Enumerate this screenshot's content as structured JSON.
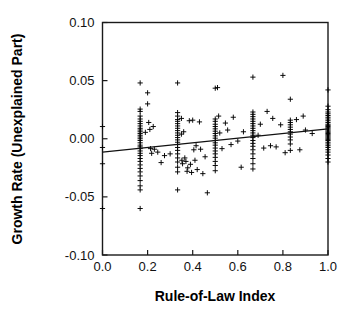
{
  "chart_data": {
    "type": "scatter",
    "title": "",
    "subtitle": "",
    "xlabel": "Rule-of-Law Index",
    "ylabel": "Growth Rate (Unexplained Part)",
    "xlim": [
      0.0,
      1.0
    ],
    "ylim": [
      -0.1,
      0.1
    ],
    "xticks": [
      0.0,
      0.2,
      0.4,
      0.6,
      0.8,
      1.0
    ],
    "xtick_labels": [
      "0.0",
      "0.2",
      "0.4",
      "0.6",
      "0.8",
      "1.0"
    ],
    "yticks": [
      -0.1,
      -0.05,
      0.0,
      0.05,
      0.1
    ],
    "ytick_labels": [
      "-0.10",
      "-0.05",
      "0.00",
      "0.05",
      "0.10"
    ],
    "grid": false,
    "legend": null,
    "marker": "plus",
    "marker_color": "#000000",
    "frame_color": "#1a1a1a",
    "background_color": "#ffffff",
    "annotations": [],
    "trendline": {
      "type": "linear-fit",
      "color": "#111111",
      "x_start": 0.0,
      "y_start": -0.0115,
      "x_end": 1.0,
      "y_end": 0.0085,
      "slope": 0.02,
      "intercept": -0.0115
    },
    "points": [
      [
        0.0,
        0.0105
      ],
      [
        0.0,
        -0.0075
      ],
      [
        0.0,
        -0.0215
      ],
      [
        0.0,
        -0.06
      ],
      [
        0.167,
        0.048
      ],
      [
        0.167,
        0.0255
      ],
      [
        0.167,
        0.0235
      ],
      [
        0.167,
        0.0195
      ],
      [
        0.167,
        0.017
      ],
      [
        0.167,
        0.015
      ],
      [
        0.167,
        0.013
      ],
      [
        0.167,
        0.011
      ],
      [
        0.167,
        0.009
      ],
      [
        0.167,
        0.0075
      ],
      [
        0.167,
        0.006
      ],
      [
        0.167,
        0.0045
      ],
      [
        0.167,
        0.003
      ],
      [
        0.167,
        0.0015
      ],
      [
        0.167,
        0.0
      ],
      [
        0.167,
        -0.0015
      ],
      [
        0.167,
        -0.0035
      ],
      [
        0.167,
        -0.0055
      ],
      [
        0.167,
        -0.007
      ],
      [
        0.167,
        -0.0085
      ],
      [
        0.167,
        -0.0105
      ],
      [
        0.167,
        -0.0125
      ],
      [
        0.167,
        -0.0145
      ],
      [
        0.167,
        -0.017
      ],
      [
        0.167,
        -0.0195
      ],
      [
        0.167,
        -0.0225
      ],
      [
        0.167,
        -0.0255
      ],
      [
        0.167,
        -0.0285
      ],
      [
        0.167,
        -0.032
      ],
      [
        0.167,
        -0.036
      ],
      [
        0.167,
        -0.0405
      ],
      [
        0.167,
        -0.044
      ],
      [
        0.167,
        -0.06
      ],
      [
        0.19,
        0.0055
      ],
      [
        0.2,
        0.0395
      ],
      [
        0.2,
        0.03
      ],
      [
        0.205,
        0.014
      ],
      [
        0.21,
        0.008
      ],
      [
        0.213,
        -0.0085
      ],
      [
        0.218,
        -0.0125
      ],
      [
        0.225,
        0.0105
      ],
      [
        0.23,
        -0.009
      ],
      [
        0.245,
        -0.0115
      ],
      [
        0.26,
        -0.0205
      ],
      [
        0.275,
        -0.0145
      ],
      [
        0.3,
        -0.013
      ],
      [
        0.333,
        0.048
      ],
      [
        0.333,
        0.0225
      ],
      [
        0.333,
        0.0195
      ],
      [
        0.333,
        0.0165
      ],
      [
        0.333,
        0.015
      ],
      [
        0.333,
        0.013
      ],
      [
        0.333,
        0.011
      ],
      [
        0.333,
        0.009
      ],
      [
        0.333,
        0.007
      ],
      [
        0.333,
        0.005
      ],
      [
        0.333,
        0.003
      ],
      [
        0.333,
        0.001
      ],
      [
        0.333,
        -0.001
      ],
      [
        0.333,
        -0.003
      ],
      [
        0.333,
        -0.005
      ],
      [
        0.333,
        -0.0075
      ],
      [
        0.333,
        -0.01
      ],
      [
        0.333,
        -0.013
      ],
      [
        0.333,
        -0.0165
      ],
      [
        0.333,
        -0.02
      ],
      [
        0.333,
        -0.0245
      ],
      [
        0.333,
        -0.0285
      ],
      [
        0.333,
        -0.044
      ],
      [
        0.35,
        0.0175
      ],
      [
        0.35,
        0.004
      ],
      [
        0.352,
        -0.0185
      ],
      [
        0.355,
        -0.0215
      ],
      [
        0.36,
        0.006
      ],
      [
        0.365,
        -0.0165
      ],
      [
        0.37,
        -0.0195
      ],
      [
        0.375,
        -0.028
      ],
      [
        0.378,
        -0.025
      ],
      [
        0.385,
        0.0155
      ],
      [
        0.39,
        -0.022
      ],
      [
        0.395,
        -0.029
      ],
      [
        0.4,
        0.016
      ],
      [
        0.405,
        -0.0095
      ],
      [
        0.41,
        -0.0185
      ],
      [
        0.415,
        -0.006
      ],
      [
        0.42,
        -0.0265
      ],
      [
        0.43,
        0.0145
      ],
      [
        0.435,
        -0.009
      ],
      [
        0.445,
        -0.03
      ],
      [
        0.455,
        -0.0155
      ],
      [
        0.465,
        -0.0465
      ],
      [
        0.5,
        0.0435
      ],
      [
        0.5,
        0.017
      ],
      [
        0.5,
        0.015
      ],
      [
        0.5,
        0.0125
      ],
      [
        0.5,
        0.0105
      ],
      [
        0.5,
        0.0085
      ],
      [
        0.5,
        0.0065
      ],
      [
        0.5,
        0.0045
      ],
      [
        0.5,
        0.0025
      ],
      [
        0.5,
        0.0005
      ],
      [
        0.5,
        -0.0015
      ],
      [
        0.5,
        -0.0035
      ],
      [
        0.5,
        -0.0055
      ],
      [
        0.5,
        -0.008
      ],
      [
        0.5,
        -0.0105
      ],
      [
        0.5,
        -0.013
      ],
      [
        0.5,
        -0.016
      ],
      [
        0.5,
        -0.0195
      ],
      [
        0.5,
        -0.023
      ],
      [
        0.5,
        -0.0275
      ],
      [
        0.51,
        0.044
      ],
      [
        0.515,
        0.0195
      ],
      [
        0.52,
        0.005
      ],
      [
        0.53,
        -0.0085
      ],
      [
        0.545,
        0.0135
      ],
      [
        0.555,
        0.0075
      ],
      [
        0.57,
        -0.005
      ],
      [
        0.58,
        0.0185
      ],
      [
        0.6,
        -0.002
      ],
      [
        0.615,
        -0.0245
      ],
      [
        0.625,
        0.006
      ],
      [
        0.667,
        0.053
      ],
      [
        0.667,
        0.023
      ],
      [
        0.667,
        0.021
      ],
      [
        0.667,
        0.019
      ],
      [
        0.667,
        0.017
      ],
      [
        0.667,
        0.015
      ],
      [
        0.667,
        0.013
      ],
      [
        0.667,
        0.011
      ],
      [
        0.667,
        0.009
      ],
      [
        0.667,
        0.007
      ],
      [
        0.667,
        0.005
      ],
      [
        0.667,
        0.003
      ],
      [
        0.667,
        0.001
      ],
      [
        0.667,
        -0.0015
      ],
      [
        0.667,
        -0.004
      ],
      [
        0.667,
        -0.0065
      ],
      [
        0.667,
        -0.0095
      ],
      [
        0.667,
        -0.013
      ],
      [
        0.667,
        -0.017
      ],
      [
        0.667,
        -0.0215
      ],
      [
        0.667,
        -0.026
      ],
      [
        0.69,
        0.003
      ],
      [
        0.7,
        0.0125
      ],
      [
        0.715,
        -0.008
      ],
      [
        0.73,
        0.0235
      ],
      [
        0.745,
        -0.006
      ],
      [
        0.755,
        0.0175
      ],
      [
        0.77,
        -0.007
      ],
      [
        0.79,
        0.012
      ],
      [
        0.8,
        0.0545
      ],
      [
        0.81,
        -0.012
      ],
      [
        0.833,
        0.034
      ],
      [
        0.833,
        0.016
      ],
      [
        0.833,
        0.014
      ],
      [
        0.833,
        0.012
      ],
      [
        0.833,
        0.01
      ],
      [
        0.833,
        0.008
      ],
      [
        0.833,
        0.006
      ],
      [
        0.833,
        0.004
      ],
      [
        0.833,
        0.0015
      ],
      [
        0.833,
        -0.001
      ],
      [
        0.833,
        -0.0045
      ],
      [
        0.833,
        -0.01
      ],
      [
        0.86,
        0.0165
      ],
      [
        0.875,
        -0.0095
      ],
      [
        0.89,
        0.0195
      ],
      [
        0.9,
        0.0075
      ],
      [
        0.93,
        0.0045
      ],
      [
        1.0,
        0.042
      ],
      [
        1.0,
        0.028
      ],
      [
        1.0,
        0.025
      ],
      [
        1.0,
        0.023
      ],
      [
        1.0,
        0.0215
      ],
      [
        1.0,
        0.02
      ],
      [
        1.0,
        0.0185
      ],
      [
        1.0,
        0.017
      ],
      [
        1.0,
        0.0155
      ],
      [
        1.0,
        0.014
      ],
      [
        1.0,
        0.0125
      ],
      [
        1.0,
        0.0115
      ],
      [
        1.0,
        0.0105
      ],
      [
        1.0,
        0.0095
      ],
      [
        1.0,
        0.0085
      ],
      [
        1.0,
        0.0075
      ],
      [
        1.0,
        0.0065
      ],
      [
        1.0,
        0.0055
      ],
      [
        1.0,
        0.0045
      ],
      [
        1.0,
        0.0035
      ],
      [
        1.0,
        0.0025
      ],
      [
        1.0,
        0.0015
      ],
      [
        1.0,
        0.0005
      ],
      [
        1.0,
        -0.0005
      ],
      [
        1.0,
        -0.0015
      ],
      [
        1.0,
        -0.003
      ],
      [
        1.0,
        -0.0045
      ],
      [
        1.0,
        -0.006
      ],
      [
        1.0,
        -0.0075
      ],
      [
        1.0,
        -0.0095
      ],
      [
        1.0,
        -0.0115
      ],
      [
        1.0,
        -0.014
      ],
      [
        1.0,
        -0.017
      ],
      [
        1.0,
        -0.02
      ]
    ]
  }
}
